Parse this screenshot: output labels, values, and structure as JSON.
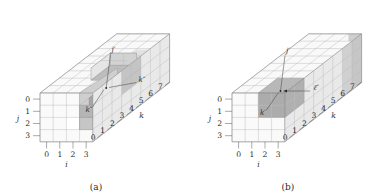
{
  "figure": {
    "type": "diagram",
    "panels": [
      {
        "id": "a",
        "caption": "(a)",
        "axes": {
          "i": {
            "label": "i",
            "ticks": [
              "0",
              "1",
              "2",
              "3"
            ],
            "position": "bottom"
          },
          "j": {
            "label": "j",
            "ticks": [
              "0",
              "1",
              "2",
              "3"
            ],
            "position": "left"
          },
          "k": {
            "label": "k",
            "ticks": [
              "0",
              "1",
              "2",
              "3",
              "4",
              "5",
              "6",
              "7"
            ],
            "position": "right-diagonal"
          }
        },
        "annotations": [
          {
            "name": "j-prime",
            "text": "j′",
            "kind": "leader-to-point"
          },
          {
            "name": "k-double-prime-left",
            "text": "k″",
            "kind": "leader-to-point"
          },
          {
            "name": "k-double-prime-right",
            "text": "k″",
            "kind": "leader-to-point"
          }
        ],
        "features": [
          "notch-cut-out-of-top-front",
          "dark-shaded-core-cells",
          "mid-shaded-surrounding-cells"
        ]
      },
      {
        "id": "b",
        "caption": "(b)",
        "axes": {
          "i": {
            "label": "i",
            "ticks": [
              "0",
              "1",
              "2",
              "3"
            ],
            "position": "bottom"
          },
          "j": {
            "label": "j",
            "ticks": [
              "0",
              "1",
              "2",
              "3"
            ],
            "position": "left"
          },
          "k": {
            "label": "k",
            "ticks": [
              "0",
              "1",
              "2",
              "3",
              "4",
              "5",
              "6",
              "7"
            ],
            "position": "right-diagonal"
          }
        },
        "annotations": [
          {
            "name": "j-prime",
            "text": "j′",
            "kind": "leader-to-point"
          },
          {
            "name": "k-prime",
            "text": "k′",
            "kind": "leader-to-point"
          },
          {
            "name": "ell-double-prime",
            "text": "ℓ″",
            "kind": "leader-to-point"
          }
        ],
        "features": [
          "solid-block-no-notch",
          "dark-shaded-core-cells",
          "mid-shaded-far-face-cells"
        ]
      }
    ],
    "colors": {
      "background": "#ffffff",
      "cell_light": "#fbfbfb",
      "cell_top": "#f7f7f7",
      "cell_side": "#ececec",
      "shade_mid": "#c8c8c8",
      "shade_dark": "#a9a9a9",
      "shade_darker": "#9a9a9a",
      "grid_line": "#b9b9b9",
      "outline": "#8e8e8e",
      "text": "#2b2b2b"
    },
    "grid": {
      "nx": 4,
      "ny": 4,
      "nz": 8
    }
  }
}
